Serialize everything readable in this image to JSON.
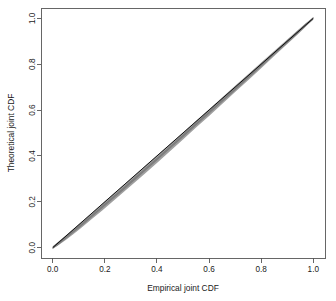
{
  "chart_data": {
    "type": "scatter",
    "title": "",
    "xlabel": "Empirical joint CDF",
    "ylabel": "Theoretical joint CDF",
    "xlim": [
      -0.045,
      1.045
    ],
    "ylim": [
      -0.045,
      1.045
    ],
    "grid": false,
    "legend": null,
    "xticks": [
      "0.0",
      "0.2",
      "0.4",
      "0.6",
      "0.8",
      "1.0"
    ],
    "xtick_values": [
      0.0,
      0.2,
      0.4,
      0.6,
      0.8,
      1.0
    ],
    "yticks": [
      "0.0",
      "0.2",
      "0.4",
      "0.6",
      "0.8",
      "1.0"
    ],
    "ytick_values": [
      0.0,
      0.2,
      0.4,
      0.6,
      0.8,
      1.0
    ],
    "series": [
      {
        "name": "reference line",
        "kind": "line",
        "color": "#000000",
        "x": [
          0.0,
          1.0
        ],
        "values": [
          0.0,
          1.0
        ]
      },
      {
        "name": "joint CDF points",
        "kind": "scatter-band",
        "color": "#8c8c8c",
        "x": [
          0.0,
          0.02,
          0.05,
          0.08,
          0.11,
          0.15,
          0.19,
          0.23,
          0.27,
          0.31,
          0.35,
          0.4,
          0.45,
          0.5,
          0.55,
          0.6,
          0.65,
          0.7,
          0.75,
          0.8,
          0.85,
          0.9,
          0.94,
          0.97,
          1.0
        ],
        "values": [
          0.0,
          0.017,
          0.044,
          0.072,
          0.1,
          0.139,
          0.178,
          0.217,
          0.256,
          0.296,
          0.336,
          0.386,
          0.437,
          0.488,
          0.539,
          0.59,
          0.641,
          0.692,
          0.744,
          0.795,
          0.847,
          0.898,
          0.939,
          0.97,
          1.0
        ],
        "band_upper": [
          0.0,
          0.021,
          0.05,
          0.079,
          0.108,
          0.148,
          0.188,
          0.228,
          0.268,
          0.308,
          0.348,
          0.398,
          0.449,
          0.499,
          0.55,
          0.6,
          0.651,
          0.702,
          0.753,
          0.804,
          0.854,
          0.904,
          0.944,
          0.974,
          1.0
        ],
        "band_lower": [
          0.0,
          0.013,
          0.037,
          0.063,
          0.09,
          0.128,
          0.166,
          0.205,
          0.244,
          0.283,
          0.323,
          0.373,
          0.424,
          0.475,
          0.527,
          0.578,
          0.63,
          0.682,
          0.734,
          0.786,
          0.839,
          0.891,
          0.933,
          0.966,
          1.0
        ]
      }
    ]
  }
}
